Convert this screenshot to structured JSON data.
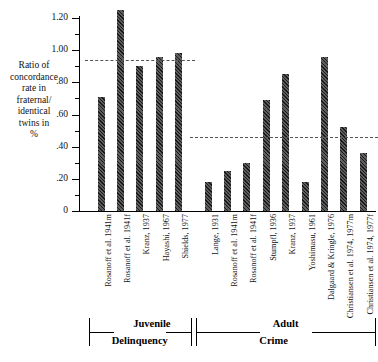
{
  "chart_data": {
    "type": "bar",
    "title": "",
    "xlabel": "",
    "ylabel": "Ratio of concordance rate in fraternal/ identical twins in %",
    "ylabel_lines": [
      "Ratio of",
      "concordance",
      "rate in",
      "fraternal/",
      "identical",
      "twins in",
      "%"
    ],
    "ylim": [
      0,
      1.2
    ],
    "grid": false,
    "legend": "none",
    "ytick_labels": [
      "0",
      ".20",
      ".40",
      ".60",
      ".80",
      "1.00",
      "1.20"
    ],
    "ytick_values": [
      0,
      0.2,
      0.4,
      0.6,
      0.8,
      1.0,
      1.2
    ],
    "yminor_step": 0.1,
    "categories": [
      "Rosanoff et al. 1941m",
      "Rosanoff et al. 1941f",
      "Kranz, 1937",
      "Hayashi, 1967",
      "Shields, 1977",
      "Lange, 1931",
      "Rosanoff et al. 1941m",
      "Rosanoff et al. 1941f",
      "Stumpfl, 1936",
      "Kranz, 1937",
      "Yoshimasu, 1961",
      "Dalgaard & Kringle, 1976",
      "Christiansen et al. 1974, 1977m",
      "Christiansen et al. 1974, 1977f"
    ],
    "values": [
      0.71,
      1.25,
      0.9,
      0.96,
      0.98,
      0.18,
      0.25,
      0.3,
      0.69,
      0.85,
      0.18,
      0.96,
      0.52,
      0.36
    ],
    "groups": [
      {
        "label_lines": [
          "Juvenile",
          "Delinquency"
        ],
        "label": "Juvenile Delinquency",
        "start_index": 0,
        "end_index": 4,
        "mean_line": 0.94
      },
      {
        "label_lines": [
          "Adult",
          "Crime"
        ],
        "label": "Adult Crime",
        "start_index": 5,
        "end_index": 13,
        "mean_line": 0.46
      }
    ],
    "annotations": [
      {
        "name": "juvenile-mean-line",
        "value": 0.94,
        "style": "dashed"
      },
      {
        "name": "adult-mean-line",
        "value": 0.46,
        "style": "dashed"
      }
    ],
    "colors": {
      "bar": "#3a3a3a",
      "axis": "#000000",
      "refline": "#555555",
      "background": "#ffffff"
    }
  }
}
